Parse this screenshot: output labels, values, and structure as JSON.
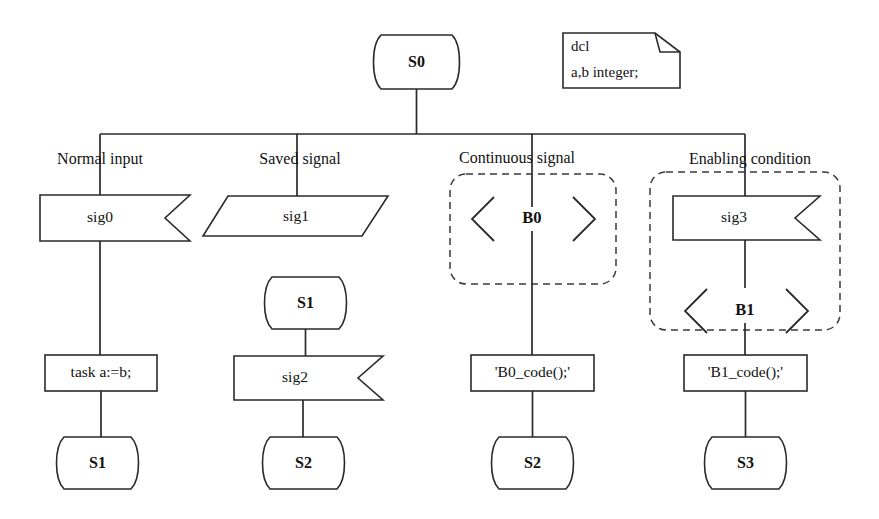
{
  "diagram": {
    "kind": "sdl-process-diagram",
    "notation": "SDL",
    "line_color": "#2a2a2a",
    "dashed_color": "#3a3a3a",
    "background": "#ffffff"
  },
  "declaration": {
    "line1": "dcl",
    "line2": "a,b integer;"
  },
  "start_state": {
    "label": "S0"
  },
  "captions": {
    "normal_input": "Normal input",
    "saved_signal": "Saved  signal",
    "continuous_signal": "Continuous  signal",
    "enabling_condition": "Enabling  condition"
  },
  "branches": [
    {
      "id": "normal-input",
      "caption": "Normal input",
      "nodes": [
        {
          "type": "input",
          "label": "sig0"
        },
        {
          "type": "task",
          "label": "task a:=b;"
        },
        {
          "type": "state",
          "label": "S1"
        }
      ]
    },
    {
      "id": "saved-signal",
      "caption": "Saved  signal",
      "nodes": [
        {
          "type": "save",
          "label": "sig1"
        },
        {
          "type": "state",
          "label": "S1"
        },
        {
          "type": "input",
          "label": "sig2"
        },
        {
          "type": "state",
          "label": "S2"
        }
      ]
    },
    {
      "id": "continuous-signal",
      "caption": "Continuous  signal",
      "grouped": true,
      "nodes": [
        {
          "type": "condition",
          "label": "B0"
        },
        {
          "type": "task",
          "label": "'B0_code();'"
        },
        {
          "type": "state",
          "label": "S2"
        }
      ]
    },
    {
      "id": "enabling-condition",
      "caption": "Enabling  condition",
      "grouped": true,
      "nodes": [
        {
          "type": "input",
          "label": "sig3"
        },
        {
          "type": "condition",
          "label": "B1"
        },
        {
          "type": "task",
          "label": "'B1_code();'"
        },
        {
          "type": "state",
          "label": "S3"
        }
      ]
    }
  ],
  "labels": {
    "s0": "S0",
    "sig0": "sig0",
    "sig1": "sig1",
    "sig2": "sig2",
    "sig3": "sig3",
    "b0": "B0",
    "b1": "B1",
    "task_assign": "task a:=b;",
    "task_b0": "'B0_code();'",
    "task_b1": "'B1_code();'",
    "state_s1_a": "S1",
    "state_s1_b": "S1",
    "state_s2_a": "S2",
    "state_s2_b": "S2",
    "state_s3": "S3"
  }
}
